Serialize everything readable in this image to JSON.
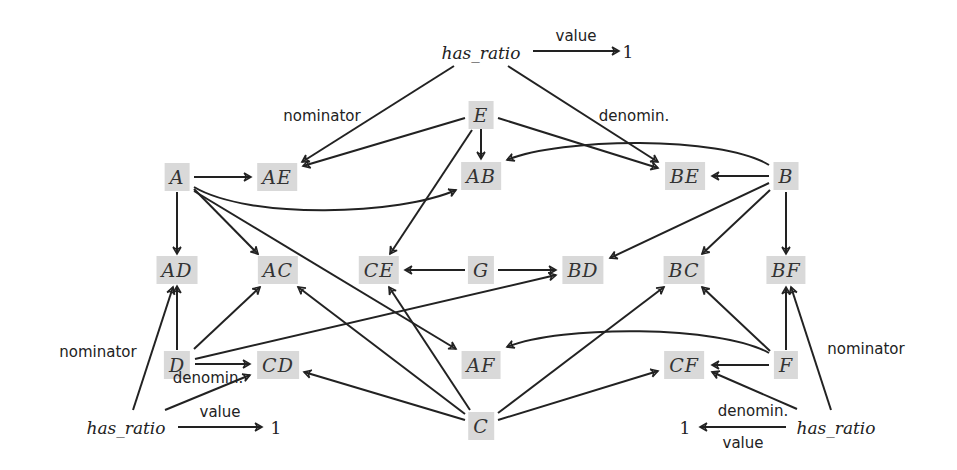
{
  "diagram": {
    "nodes": {
      "A": "A",
      "AE": "AE",
      "E": "E",
      "AB": "AB",
      "BE": "BE",
      "B": "B",
      "AD": "AD",
      "AC": "AC",
      "CE": "CE",
      "G": "G",
      "BD": "BD",
      "BC": "BC",
      "BF": "BF",
      "D": "D",
      "CD": "CD",
      "AF": "AF",
      "CF": "CF",
      "F": "F",
      "C": "C"
    },
    "ratios": {
      "top": {
        "term": "has_ratio",
        "value_label": "value",
        "value": "1",
        "nominator_label": "nominator",
        "denominator_label": "denomin."
      },
      "bottom_left": {
        "term": "has_ratio",
        "value_label": "value",
        "value": "1",
        "nominator_label": "nominator",
        "denominator_label": "denomin."
      },
      "bottom_right": {
        "term": "has_ratio",
        "value_label": "value",
        "value": "1",
        "nominator_label": "nominator",
        "denominator_label": "denomin."
      }
    },
    "colors": {
      "node_fill": "#d9d9d9",
      "edge": "#222222",
      "background": "#ffffff"
    },
    "edges": [
      [
        "A",
        "AE"
      ],
      [
        "A",
        "AD"
      ],
      [
        "A",
        "AC"
      ],
      [
        "A",
        "AB"
      ],
      [
        "A",
        "AF"
      ],
      [
        "E",
        "AE"
      ],
      [
        "E",
        "AB"
      ],
      [
        "E",
        "BE"
      ],
      [
        "E",
        "CE"
      ],
      [
        "B",
        "BE"
      ],
      [
        "B",
        "AB"
      ],
      [
        "B",
        "BD"
      ],
      [
        "B",
        "BC"
      ],
      [
        "B",
        "BF"
      ],
      [
        "G",
        "CE"
      ],
      [
        "G",
        "BD"
      ],
      [
        "D",
        "AD"
      ],
      [
        "D",
        "AC"
      ],
      [
        "D",
        "CD"
      ],
      [
        "D",
        "BD"
      ],
      [
        "C",
        "CD"
      ],
      [
        "C",
        "AC"
      ],
      [
        "C",
        "CE"
      ],
      [
        "C",
        "BC"
      ],
      [
        "C",
        "CF"
      ],
      [
        "F",
        "CF"
      ],
      [
        "F",
        "BC"
      ],
      [
        "F",
        "BF"
      ],
      [
        "F",
        "AF"
      ],
      [
        "has_ratio_top",
        "AE",
        "nominator"
      ],
      [
        "has_ratio_top",
        "BE",
        "denomin."
      ],
      [
        "has_ratio_top",
        "1",
        "value"
      ],
      [
        "has_ratio_bl",
        "AD",
        "nominator"
      ],
      [
        "has_ratio_bl",
        "CD",
        "denomin."
      ],
      [
        "has_ratio_bl",
        "1",
        "value"
      ],
      [
        "has_ratio_br",
        "BF",
        "nominator"
      ],
      [
        "has_ratio_br",
        "CF",
        "denomin."
      ],
      [
        "has_ratio_br",
        "1",
        "value"
      ]
    ]
  }
}
